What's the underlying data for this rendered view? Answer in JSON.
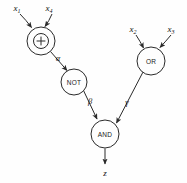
{
  "figure": {
    "kind": "boolean-circuit-diagram",
    "background_color": "#fefefe",
    "stroke_color": "#2a2a2a",
    "text_color": "#111111"
  },
  "gates": {
    "xor": {
      "label": "+",
      "symbol_name": "xor-plus-in-circle",
      "cx": 41,
      "cy": 41,
      "r": 14,
      "inner_r": 7.5
    },
    "not": {
      "label": "NOT",
      "cx": 74,
      "cy": 82,
      "r": 13
    },
    "or": {
      "label": "OR",
      "cx": 151,
      "cy": 61,
      "r": 14
    },
    "and": {
      "label": "AND",
      "cx": 105,
      "cy": 134,
      "r": 14
    }
  },
  "inputs": [
    {
      "name": "x1",
      "base": "x",
      "sub": "1",
      "label_x": 17,
      "label_y": 11
    },
    {
      "name": "x4",
      "base": "x",
      "sub": "4",
      "label_x": 49,
      "label_y": 11
    },
    {
      "name": "x2",
      "base": "x",
      "sub": "2",
      "label_x": 133,
      "label_y": 32
    },
    {
      "name": "x3",
      "base": "x",
      "sub": "3",
      "label_x": 171,
      "label_y": 32
    }
  ],
  "output": {
    "name": "z",
    "label": "z",
    "label_x": 105,
    "label_y": 173
  },
  "edge_labels": [
    {
      "name": "alpha",
      "label": "α",
      "x": 58,
      "y": 61
    },
    {
      "name": "beta",
      "label": "β",
      "x": 90,
      "y": 104
    },
    {
      "name": "gamma",
      "label": "γ",
      "x": 127,
      "y": 105
    }
  ],
  "edges": [
    {
      "from": "x1",
      "to": "xor",
      "labeled": ""
    },
    {
      "from": "x4",
      "to": "xor",
      "labeled": ""
    },
    {
      "from": "x2",
      "to": "or",
      "labeled": ""
    },
    {
      "from": "x3",
      "to": "or",
      "labeled": ""
    },
    {
      "from": "xor",
      "to": "not",
      "labeled": "α"
    },
    {
      "from": "not",
      "to": "and",
      "labeled": "β"
    },
    {
      "from": "or",
      "to": "and",
      "labeled": "γ"
    },
    {
      "from": "and",
      "to": "z",
      "labeled": ""
    }
  ]
}
